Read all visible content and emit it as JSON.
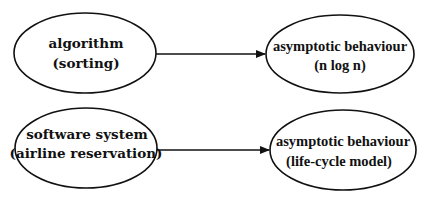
{
  "diagram": {
    "type": "flow",
    "nodes": [
      {
        "id": "n1",
        "line1": "algorithm",
        "line2": "(sorting)"
      },
      {
        "id": "n2",
        "line1": "asymptotic behaviour",
        "line2": "(n log n)"
      },
      {
        "id": "n3",
        "line1": "software system",
        "line2": "(airline reservation)"
      },
      {
        "id": "n4",
        "line1": "asymptotic behaviour",
        "line2": "(life-cycle model)"
      }
    ],
    "edges": [
      {
        "from": "n1",
        "to": "n2"
      },
      {
        "from": "n3",
        "to": "n4"
      }
    ],
    "colors": {
      "stroke": "#111111",
      "background": "#ffffff"
    }
  }
}
